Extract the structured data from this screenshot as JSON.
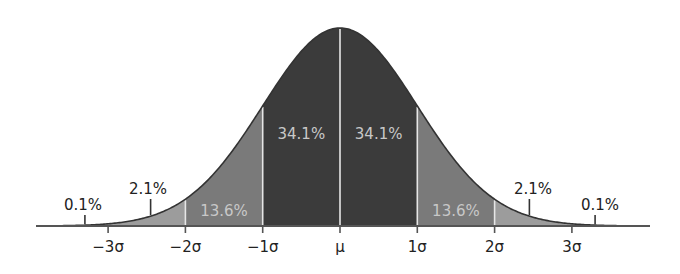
{
  "chart_data": {
    "type": "area",
    "title": "",
    "subtitle": "",
    "xlabel": "",
    "ylabel": "",
    "grid": false,
    "legend": null,
    "xlim": [
      -3.8,
      4.1
    ],
    "x_ticks": [
      -3,
      -2,
      -1,
      0,
      1,
      2,
      3
    ],
    "x_tick_labels": [
      "−3σ",
      "−2σ",
      "−1σ",
      "μ",
      "1σ",
      "2σ",
      "3σ"
    ],
    "bands": [
      {
        "from": -4,
        "to": -3,
        "percent": 0.1,
        "label": "0.1%",
        "shade": "lightest",
        "label_position": "outside"
      },
      {
        "from": -3,
        "to": -2,
        "percent": 2.1,
        "label": "2.1%",
        "shade": "light",
        "label_position": "outside"
      },
      {
        "from": -2,
        "to": -1,
        "percent": 13.6,
        "label": "13.6%",
        "shade": "medium",
        "label_position": "inside"
      },
      {
        "from": -1,
        "to": 0,
        "percent": 34.1,
        "label": "34.1%",
        "shade": "dark",
        "label_position": "inside"
      },
      {
        "from": 0,
        "to": 1,
        "percent": 34.1,
        "label": "34.1%",
        "shade": "dark",
        "label_position": "inside"
      },
      {
        "from": 1,
        "to": 2,
        "percent": 13.6,
        "label": "13.6%",
        "shade": "medium",
        "label_position": "inside"
      },
      {
        "from": 2,
        "to": 3,
        "percent": 2.1,
        "label": "2.1%",
        "shade": "light",
        "label_position": "outside"
      },
      {
        "from": 3,
        "to": 4,
        "percent": 0.1,
        "label": "0.1%",
        "shade": "lightest",
        "label_position": "outside"
      }
    ],
    "colors": {
      "dark": "#3b3b3b",
      "medium": "#7a7a7a",
      "light": "#9c9c9c",
      "lightest": "#b4b4b4",
      "curve": "#333333",
      "divider": "#e6e6e6",
      "axis": "#555555"
    }
  }
}
